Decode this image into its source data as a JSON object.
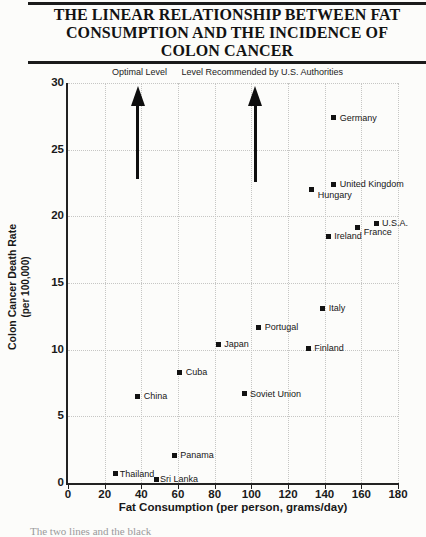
{
  "page": {
    "caption_fragment": "The two lines and the black"
  },
  "title": {
    "lines": [
      "THE LINEAR RELATIONSHIP BETWEEN FAT",
      "CONSUMPTION AND THE INCIDENCE OF",
      "COLON CANCER"
    ]
  },
  "chart_data": {
    "type": "scatter",
    "title": "The Linear Relationship Between Fat Consumption and the Incidence of Colon Cancer",
    "xlabel": "Fat Consumption (per person, grams/day)",
    "ylabel": "Colon Cancer Death Rate",
    "ylabel_sub": "(per 100,000)",
    "xlim": [
      0,
      180
    ],
    "ylim": [
      0,
      30
    ],
    "x_ticks": [
      0,
      20,
      40,
      60,
      80,
      100,
      120,
      140,
      160,
      180
    ],
    "y_ticks": [
      0,
      5,
      10,
      15,
      20,
      25,
      30
    ],
    "grid": "dotted",
    "grid_color": "#c6c6c4",
    "axis_color": "#222222",
    "marker": "filled-square",
    "marker_color": "#121212",
    "legend": "none",
    "points": [
      {
        "label": "Thailand",
        "x": 26,
        "y": 0.7,
        "label_dx": 4
      },
      {
        "label": "Sri Lanka",
        "x": 48,
        "y": 0.3,
        "label_dx": 4
      },
      {
        "label": "China",
        "x": 38,
        "y": 6.5
      },
      {
        "label": "Panama",
        "x": 58,
        "y": 2.1
      },
      {
        "label": "Cuba",
        "x": 61,
        "y": 8.3
      },
      {
        "label": "Soviet Union",
        "x": 96,
        "y": 6.7
      },
      {
        "label": "Japan",
        "x": 82,
        "y": 10.4
      },
      {
        "label": "Portugal",
        "x": 104,
        "y": 11.7
      },
      {
        "label": "Finland",
        "x": 131,
        "y": 10.1
      },
      {
        "label": "Italy",
        "x": 139,
        "y": 13.1
      },
      {
        "label": "Hungary",
        "x": 133,
        "y": 22.0,
        "label_dy": 5
      },
      {
        "label": "United Kingdom",
        "x": 145,
        "y": 22.4
      },
      {
        "label": "Ireland",
        "x": 142,
        "y": 18.5
      },
      {
        "label": "France",
        "x": 158,
        "y": 19.2,
        "label_dy": 5
      },
      {
        "label": "U.S.A.",
        "x": 168,
        "y": 19.5
      },
      {
        "label": "Germany",
        "x": 145,
        "y": 27.4
      }
    ],
    "arrows": [
      {
        "label": "Optimal Level",
        "x": 38,
        "y_base": 22.8,
        "y_tip": 29.8,
        "label_anchor_x": 39
      },
      {
        "label": "Level Recommended by U.S. Authorities",
        "x": 102,
        "y_base": 22.6,
        "y_tip": 29.8,
        "label_anchor_x": 106
      }
    ]
  }
}
